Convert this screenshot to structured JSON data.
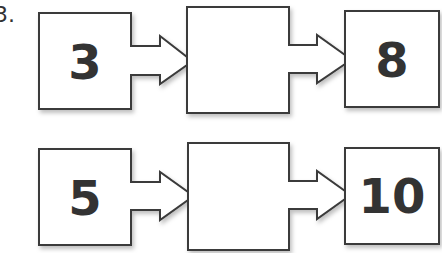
{
  "question_label": "3.",
  "rows": [
    {
      "input": "3",
      "middle": "",
      "output": "8"
    },
    {
      "input": "5",
      "middle": "",
      "output": "10"
    }
  ],
  "colors": {
    "stroke": "#3a3a3a",
    "text": "#333333",
    "background": "#ffffff"
  }
}
